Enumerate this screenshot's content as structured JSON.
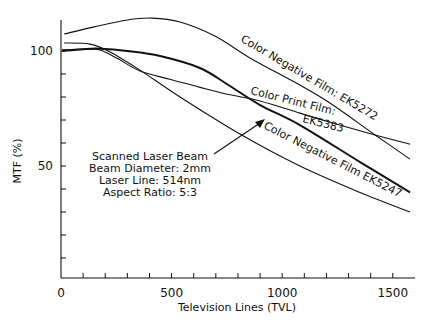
{
  "chart_data": {
    "type": "line",
    "title": "",
    "xlabel": "Television Lines (TVL)",
    "ylabel": "MTF (%)",
    "xlim": [
      0,
      1600
    ],
    "ylim": [
      0,
      113
    ],
    "grid": false,
    "x_ticks": [
      0,
      100,
      200,
      300,
      400,
      500,
      600,
      700,
      800,
      900,
      1000,
      1100,
      1200,
      1300,
      1400,
      1500
    ],
    "x_tick_labels": [
      {
        "value": 0,
        "label": "0"
      },
      {
        "value": 500,
        "label": "500"
      },
      {
        "value": 1000,
        "label": "1000"
      },
      {
        "value": 1500,
        "label": "1500"
      }
    ],
    "y_ticks": [
      10,
      20,
      30,
      40,
      50,
      60,
      70,
      80,
      90,
      100
    ],
    "y_tick_labels": [
      {
        "value": 50,
        "label": "50"
      },
      {
        "value": 100,
        "label": "100"
      }
    ],
    "series": [
      {
        "name": "Color Negative Film: EK5272",
        "stroke_width": 1.1,
        "x": [
          14,
          150,
          300,
          411,
          538,
          696,
          854,
          1080,
          1216,
          1420,
          1578
        ],
        "y": [
          107.4,
          110.5,
          113.5,
          114.3,
          112.6,
          106.5,
          97.0,
          85.2,
          77.4,
          63.5,
          53.0
        ]
      },
      {
        "name": "Color Print Film: EK5383",
        "stroke_width": 1.1,
        "x": [
          5,
          100,
          176,
          260,
          357,
          500,
          728,
          900,
          1080,
          1216,
          1420,
          1578
        ],
        "y": [
          100.5,
          100.8,
          100.4,
          96.5,
          91.3,
          87.5,
          81.7,
          78.3,
          73.0,
          69.0,
          63.5,
          59.5
        ]
      },
      {
        "name": "Scanned Laser Beam",
        "stroke_width": 2,
        "x": [
          5,
          100,
          176,
          300,
          448,
          628,
          760,
          900,
          1080,
          1352,
          1578
        ],
        "y": [
          100.0,
          100.8,
          101.0,
          100.0,
          97.8,
          92.6,
          85.0,
          76.5,
          67.8,
          51.7,
          38.5
        ]
      },
      {
        "name": "Color Negative Film EK5247",
        "stroke_width": 1.1,
        "x": [
          14,
          131,
          222,
          357,
          538,
          809,
          1080,
          1352,
          1578
        ],
        "y": [
          103.5,
          103.0,
          99.6,
          91.7,
          80.0,
          63.9,
          50.0,
          38.5,
          30.0
        ]
      }
    ],
    "annotations": {
      "laser_block": [
        "Scanned Laser Beam",
        "Beam Diameter: 2mm",
        "Laser Line: 514nm",
        "Aspect Ratio: 5:3"
      ],
      "labels": {
        "ek5272": "Color Negative Film: EK5272",
        "ek5383_line1": "Color Print Film:",
        "ek5383_line2": "EK5383",
        "ek5247": "Color Negative Film EK5247"
      }
    }
  }
}
